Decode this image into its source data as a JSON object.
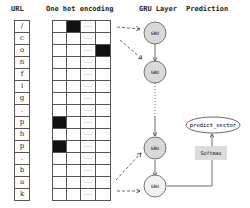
{
  "headers": {
    "url": "URL",
    "encoding": "One hot encoding",
    "gru_layer": "GRU Layer",
    "prediction": "Prediction"
  },
  "url_chars": [
    "/",
    "c",
    "o",
    "n",
    "f",
    "i",
    "g",
    ".",
    "p",
    "h",
    "p",
    ".",
    "b",
    "a",
    "k"
  ],
  "one_hot": {
    "columns": 4,
    "ellipsis_column": 2,
    "ellipsis_symbol": "...",
    "hot_positions": [
      {
        "row": 0,
        "col": 1
      },
      {
        "row": 2,
        "col": 3
      },
      {
        "row": 8,
        "col": 0
      },
      {
        "row": 10,
        "col": 0
      }
    ]
  },
  "gru_nodes": [
    {
      "label": "GRU"
    },
    {
      "label": "GRU"
    },
    {
      "label": "GRU"
    },
    {
      "label": "GRU"
    }
  ],
  "softmax_label": "Softmax",
  "output_label": "predict_vector",
  "colors": {
    "gru_fill": "#d9d9d9",
    "softmax_fill": "#dcdcdc",
    "hot_cell": "#111111",
    "line": "#444444"
  }
}
